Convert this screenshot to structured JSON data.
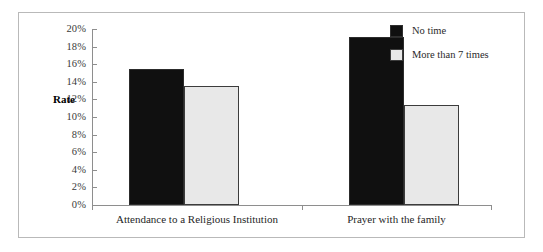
{
  "chart_data": {
    "type": "bar",
    "title": "",
    "xlabel": "",
    "ylabel": "Rate",
    "ylim": [
      0,
      20
    ],
    "grid": false,
    "legend_position": "top-right",
    "categories": [
      "Attendance to a Religious Institution",
      "Prayer with the family"
    ],
    "series": [
      {
        "name": "No time",
        "color": "#101010",
        "values": [
          15.5,
          19.1
        ]
      },
      {
        "name": "More than 7 times",
        "color": "#e8e8e8",
        "values": [
          13.5,
          11.4
        ]
      }
    ],
    "ytick_labels": [
      "20%",
      "18%",
      "16%",
      "14%",
      "12%",
      "10%",
      "8%",
      "6%",
      "4%",
      "2%",
      "0%"
    ],
    "ytick_values": [
      20,
      18,
      16,
      14,
      12,
      10,
      8,
      6,
      4,
      2,
      0
    ]
  },
  "axis": {
    "rate_label": "Rate"
  }
}
